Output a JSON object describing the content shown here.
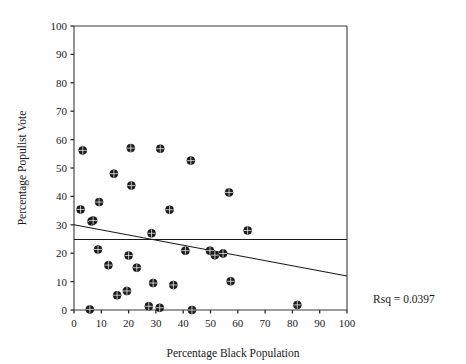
{
  "chart_data": {
    "type": "scatter",
    "title": "",
    "xlabel": "Percentage Black Population",
    "ylabel": "Percentage Populist Vote",
    "xlim": [
      0,
      100
    ],
    "ylim": [
      0,
      100
    ],
    "xticks": [
      0,
      10,
      20,
      30,
      40,
      50,
      60,
      70,
      80,
      90,
      100
    ],
    "yticks": [
      0,
      10,
      20,
      30,
      40,
      50,
      60,
      70,
      80,
      90,
      100
    ],
    "xtick_labels": [
      "0",
      "10",
      "20",
      "30",
      "40",
      "50",
      "60",
      "70",
      "80",
      "90",
      "100"
    ],
    "ytick_labels": [
      "0",
      "10",
      "20",
      "30",
      "40",
      "50",
      "60",
      "70",
      "80",
      "90",
      "100"
    ],
    "grid": false,
    "legend": null,
    "marker": "circle-with-crosshair",
    "points": [
      {
        "x": 2.4,
        "y": 35.4
      },
      {
        "x": 3.2,
        "y": 56.2
      },
      {
        "x": 5.8,
        "y": 0.2
      },
      {
        "x": 6.4,
        "y": 31.2
      },
      {
        "x": 7.0,
        "y": 31.5
      },
      {
        "x": 8.8,
        "y": 21.3
      },
      {
        "x": 9.2,
        "y": 38.0
      },
      {
        "x": 12.6,
        "y": 15.8
      },
      {
        "x": 14.6,
        "y": 48.0
      },
      {
        "x": 15.8,
        "y": 5.2
      },
      {
        "x": 19.4,
        "y": 6.7
      },
      {
        "x": 20.0,
        "y": 19.2
      },
      {
        "x": 20.8,
        "y": 57.0
      },
      {
        "x": 21.0,
        "y": 43.8
      },
      {
        "x": 23.0,
        "y": 14.9
      },
      {
        "x": 27.4,
        "y": 1.3
      },
      {
        "x": 28.4,
        "y": 27.0
      },
      {
        "x": 29.0,
        "y": 9.5
      },
      {
        "x": 31.4,
        "y": 0.8
      },
      {
        "x": 31.6,
        "y": 56.8
      },
      {
        "x": 35.0,
        "y": 35.3
      },
      {
        "x": 36.4,
        "y": 8.8
      },
      {
        "x": 40.8,
        "y": 20.9
      },
      {
        "x": 42.8,
        "y": 52.6
      },
      {
        "x": 43.2,
        "y": 0.0
      },
      {
        "x": 49.8,
        "y": 20.9
      },
      {
        "x": 51.6,
        "y": 19.3
      },
      {
        "x": 54.6,
        "y": 19.9
      },
      {
        "x": 56.8,
        "y": 41.4
      },
      {
        "x": 57.4,
        "y": 10.1
      },
      {
        "x": 63.6,
        "y": 28.0
      },
      {
        "x": 81.8,
        "y": 1.8
      }
    ],
    "trend_line": {
      "name": "regression-line",
      "x0": 0,
      "y0": 30.0,
      "x1": 100,
      "y1": 12.0
    },
    "mean_line": {
      "name": "mean-reference-line",
      "x0": 0,
      "y0": 24.8,
      "x1": 100,
      "y1": 24.8
    },
    "annotations": [
      {
        "name": "rsq-annotation",
        "text": "Rsq = 0.0397",
        "x_px": 373,
        "y_px": 303
      }
    ]
  }
}
